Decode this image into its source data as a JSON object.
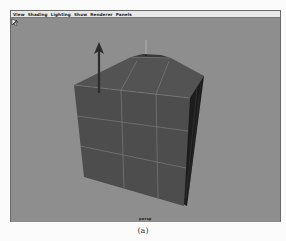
{
  "viewport_panel": {
    "menus": [
      "View",
      "Shading",
      "Lighting",
      "Show",
      "Renderer",
      "Panels"
    ],
    "camera_label": "persp",
    "background_color": "#8e8e8e"
  },
  "scene": {
    "object": "beveled-cube",
    "manipulator": "move-arrow-y",
    "object_color": "#4a4a4a"
  },
  "caption": "(a)"
}
